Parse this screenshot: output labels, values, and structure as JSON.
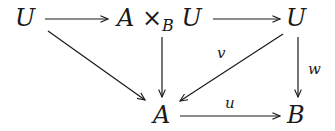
{
  "diagram": {
    "type": "commutative-diagram",
    "nodes": {
      "u_left": "U",
      "pullback_A": "A",
      "pullback_times": "×",
      "pullback_sub": "B",
      "pullback_U": "U",
      "u_right": "U",
      "a_bottom": "A",
      "b_bottom": "B"
    },
    "labels": {
      "v": "v",
      "w": "w",
      "u": "u"
    },
    "arrows": [
      {
        "from": "U",
        "to": "A ×_B U",
        "label": ""
      },
      {
        "from": "A ×_B U",
        "to": "U",
        "label": ""
      },
      {
        "from": "U",
        "to": "A",
        "label": ""
      },
      {
        "from": "A ×_B U",
        "to": "A",
        "label": ""
      },
      {
        "from": "U",
        "to": "A",
        "label": "v"
      },
      {
        "from": "U",
        "to": "B",
        "label": "w"
      },
      {
        "from": "A",
        "to": "B",
        "label": "u"
      }
    ]
  }
}
